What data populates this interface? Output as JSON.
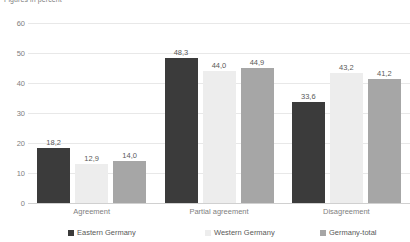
{
  "chart_data": {
    "type": "bar",
    "title": "",
    "unit_caption": "Figures in percent",
    "xlabel": "",
    "ylabel": "",
    "ylim": [
      0,
      60
    ],
    "yticks": [
      0,
      10,
      20,
      30,
      40,
      50,
      60
    ],
    "ytick_labels": [
      "0",
      "10",
      "20",
      "30",
      "40",
      "50",
      "60"
    ],
    "grid": true,
    "legend_position": "bottom",
    "categories": [
      "Agreement",
      "Partial agreement",
      "Disagreement"
    ],
    "series": [
      {
        "name": "Eastern Germany",
        "color": "#3B3B3B",
        "values": [
          18.2,
          48.3,
          33.6
        ],
        "labels": [
          "18,2",
          "48,3",
          "33,6"
        ]
      },
      {
        "name": "Western Germany",
        "color": "#EDEDED",
        "values": [
          12.9,
          44.0,
          43.2
        ],
        "labels": [
          "12,9",
          "44,0",
          "43,2"
        ]
      },
      {
        "name": "Germany-total",
        "color": "#A6A6A6",
        "values": [
          14.0,
          44.9,
          41.2
        ],
        "labels": [
          "14,0",
          "44,9",
          "41,2"
        ]
      }
    ]
  }
}
